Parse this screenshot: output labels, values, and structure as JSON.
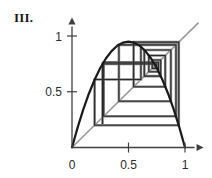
{
  "figure": {
    "panel_label": "III.",
    "background": "#ffffff"
  },
  "colors": {
    "curve": "#1a1a1a",
    "axis": "#404040",
    "diagonal": "#9a9a9a",
    "cobweb_dark": "#2b2b2b",
    "cobweb_light": "#8c8c8c",
    "text": "#2b2b2b"
  },
  "axes": {
    "x_label": "",
    "y_label": "",
    "xlim": [
      0,
      1.12
    ],
    "ylim": [
      0,
      1.12
    ],
    "x_ticks": [
      {
        "value": 0,
        "label": "0"
      },
      {
        "value": 0.5,
        "label": "0.5"
      },
      {
        "value": 1,
        "label": "1"
      }
    ],
    "y_ticks": [
      {
        "value": 0.5,
        "label": "0.5"
      },
      {
        "value": 1,
        "label": "1"
      }
    ],
    "origin_px": {
      "x": 72,
      "y": 147.5
    },
    "unit_px": {
      "x": 113,
      "y": 111.5
    },
    "arrow_x": true,
    "arrow_y": true
  },
  "chart_data": {
    "type": "line",
    "title": "III.",
    "xlabel": "",
    "ylabel": "",
    "xlim": [
      0,
      1.12
    ],
    "ylim": [
      0,
      1.12
    ],
    "grid": false,
    "legend": null,
    "series": [
      {
        "name": "logistic map f(x) = r x (1 - x)",
        "kind": "parabola",
        "r": 3.8,
        "peak": {
          "x": 0.5,
          "y": 0.95
        },
        "x": [
          0.0,
          0.05,
          0.1,
          0.15,
          0.2,
          0.25,
          0.3,
          0.35,
          0.4,
          0.45,
          0.5,
          0.55,
          0.6,
          0.65,
          0.7,
          0.75,
          0.8,
          0.85,
          0.9,
          0.95,
          1.0
        ],
        "y": [
          0.0,
          0.1805,
          0.342,
          0.4845,
          0.608,
          0.7125,
          0.798,
          0.8645,
          0.912,
          0.9405,
          0.95,
          0.9405,
          0.912,
          0.8645,
          0.798,
          0.7125,
          0.608,
          0.4845,
          0.342,
          0.1805,
          0.0
        ]
      },
      {
        "name": "identity line y = x",
        "kind": "diagonal",
        "x": [
          0.0,
          1.12
        ],
        "y": [
          0.0,
          1.12
        ]
      },
      {
        "name": "cobweb orbit",
        "kind": "cobweb",
        "comment": "staircase / spiderweb iteration path of the logistic map",
        "vertices": [
          [
            0.27,
            0.21
          ],
          [
            0.27,
            0.75
          ],
          [
            0.75,
            0.75
          ],
          [
            0.75,
            0.71
          ],
          [
            0.71,
            0.71
          ],
          [
            0.71,
            0.785
          ],
          [
            0.785,
            0.785
          ],
          [
            0.785,
            0.64
          ],
          [
            0.64,
            0.64
          ],
          [
            0.64,
            0.875
          ],
          [
            0.875,
            0.875
          ],
          [
            0.875,
            0.415
          ],
          [
            0.415,
            0.415
          ],
          [
            0.415,
            0.92
          ],
          [
            0.92,
            0.92
          ],
          [
            0.92,
            0.28
          ],
          [
            0.28,
            0.28
          ],
          [
            0.28,
            0.765
          ],
          [
            0.765,
            0.765
          ],
          [
            0.765,
            0.68
          ],
          [
            0.68,
            0.68
          ],
          [
            0.68,
            0.825
          ],
          [
            0.825,
            0.825
          ],
          [
            0.825,
            0.545
          ],
          [
            0.545,
            0.545
          ],
          [
            0.545,
            0.945
          ],
          [
            0.945,
            0.945
          ],
          [
            0.945,
            0.2
          ],
          [
            0.2,
            0.2
          ],
          [
            0.2,
            0.61
          ],
          [
            0.61,
            0.61
          ],
          [
            0.61,
            0.905
          ]
        ]
      }
    ],
    "annotations": [
      {
        "text": "III.",
        "position": "top-left"
      }
    ]
  }
}
